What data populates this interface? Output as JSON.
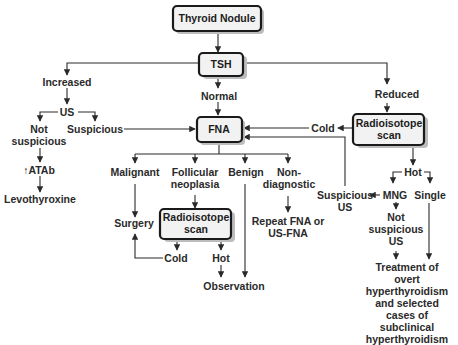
{
  "diagram": {
    "boxes": {
      "root": "Thyroid Nodule",
      "tsh": "TSH",
      "fna": "FNA",
      "radio_right_l1": "Radioisotope",
      "radio_right_l2": "scan",
      "radio_mid_l1": "Radioisotope",
      "radio_mid_l2": "scan"
    },
    "labels": {
      "increased": "Increased",
      "normal": "Normal",
      "reduced": "Reduced",
      "us": "US",
      "not_suspicious_l1": "Not",
      "not_suspicious_l2": "suspicious",
      "suspicious": "Suspicious",
      "atab": "↑ATAb",
      "levothyroxine": "Levothyroxine",
      "cold_right": "Cold",
      "malignant": "Malignant",
      "follicular_l1": "Follicular",
      "follicular_l2": "neoplasia",
      "benign": "Benign",
      "nondiag_l1": "Non-",
      "nondiag_l2": "diagnostic",
      "suspicious_us_l1": "Suspicious",
      "suspicious_us_l2": "US",
      "hot_right": "Hot",
      "mng": "MNG",
      "single": "Single",
      "surgery": "Surgery",
      "repeat_l1": "Repeat FNA or",
      "repeat_l2": "US-FNA",
      "cold_mid": "Cold",
      "hot_mid": "Hot",
      "observation": "Observation",
      "not_susp_us_l1": "Not",
      "not_susp_us_l2": "suspicious",
      "not_susp_us_l3": "US",
      "treatment_l1": "Treatment of",
      "treatment_l2": "overt",
      "treatment_l3": "hyperthyroidism",
      "treatment_l4": "and selected",
      "treatment_l5": "cases of",
      "treatment_l6": "subclinical",
      "treatment_l7": "hyperthyroidism"
    }
  }
}
